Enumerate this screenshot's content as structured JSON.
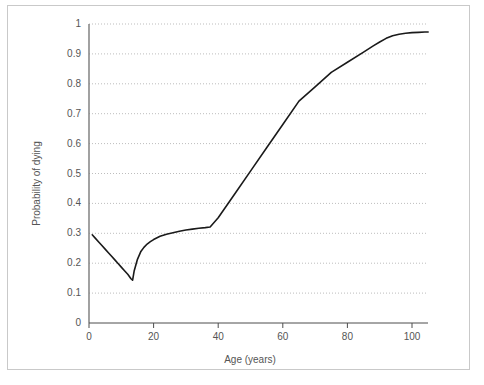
{
  "chart_data": {
    "type": "line",
    "title": "",
    "xlabel": "Age (years)",
    "ylabel": "Probability of dying",
    "xlim": [
      0,
      105
    ],
    "ylim": [
      0,
      1
    ],
    "xticks": [
      0,
      20,
      40,
      60,
      80,
      100
    ],
    "xtick_labels": [
      "0",
      "20",
      "40",
      "60",
      "80",
      "100"
    ],
    "yticks": [
      0,
      0.1,
      0.2,
      0.3,
      0.4,
      0.5,
      0.6,
      0.7,
      0.8,
      0.9,
      1
    ],
    "ytick_labels": [
      "0",
      "0.1",
      "0.2",
      "0.3",
      "0.4",
      "0.5",
      "0.6",
      "0.7",
      "0.8",
      "0.9",
      "1"
    ],
    "grid": "horizontal-dotted",
    "legend": "none",
    "line_color": "#1a1a1a",
    "grid_color": "#bdbdbd",
    "axis_color": "#7a7a7a",
    "frame_color": "#c9c9c9",
    "series": [
      {
        "name": "Probability of dying",
        "x": [
          1,
          2,
          3,
          4,
          5,
          6,
          7,
          8,
          9,
          10,
          11,
          12,
          13,
          13.5,
          14,
          15,
          16,
          17,
          18,
          19,
          20,
          22,
          24,
          26,
          28,
          30,
          32,
          34,
          36,
          37.5,
          40,
          45,
          50,
          55,
          60,
          65,
          70,
          75,
          80,
          85,
          88,
          90,
          92,
          94,
          96,
          98,
          100,
          102,
          104,
          105
        ],
        "y": [
          0.295,
          0.283,
          0.271,
          0.259,
          0.247,
          0.235,
          0.223,
          0.211,
          0.199,
          0.187,
          0.175,
          0.163,
          0.148,
          0.143,
          0.175,
          0.213,
          0.238,
          0.253,
          0.264,
          0.272,
          0.279,
          0.29,
          0.297,
          0.302,
          0.307,
          0.311,
          0.314,
          0.317,
          0.319,
          0.321,
          0.352,
          0.43,
          0.508,
          0.586,
          0.664,
          0.742,
          0.79,
          0.838,
          0.872,
          0.906,
          0.927,
          0.94,
          0.952,
          0.961,
          0.966,
          0.969,
          0.971,
          0.972,
          0.973,
          0.973
        ]
      }
    ]
  },
  "axes": {
    "x_title": "Age (years)",
    "y_title": "Probability of dying"
  }
}
